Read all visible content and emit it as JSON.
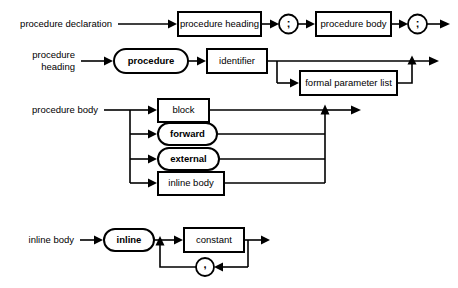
{
  "diagram": {
    "kind": "railroad-syntax-diagram",
    "background_color": "#ffffff",
    "line_color": "#000000",
    "rules": [
      {
        "id": "procedure-declaration",
        "label": "procedure declaration",
        "nodes": [
          {
            "name": "procedure-heading",
            "text": "procedure heading",
            "shape": "rect"
          },
          {
            "name": "semicolon-1",
            "text": ";",
            "shape": "circle"
          },
          {
            "name": "procedure-body",
            "text": "procedure body",
            "shape": "rect"
          },
          {
            "name": "semicolon-2",
            "text": ";",
            "shape": "circle"
          }
        ]
      },
      {
        "id": "procedure-heading",
        "label_line1": "procedure",
        "label_line2": "heading",
        "label": "procedure heading",
        "nodes": [
          {
            "name": "procedure-keyword",
            "text": "procedure",
            "shape": "stadium"
          },
          {
            "name": "identifier",
            "text": "identifier",
            "shape": "rect"
          },
          {
            "name": "formal-parameter-list",
            "text": "formal parameter list",
            "shape": "rect",
            "optional": true
          }
        ]
      },
      {
        "id": "procedure-body",
        "label": "procedure body",
        "alternatives": [
          {
            "name": "block",
            "text": "block",
            "shape": "rect"
          },
          {
            "name": "forward",
            "text": "forward",
            "shape": "stadium"
          },
          {
            "name": "external",
            "text": "external",
            "shape": "stadium"
          },
          {
            "name": "inline-body",
            "text": "inline body",
            "shape": "rect"
          }
        ]
      },
      {
        "id": "inline-body",
        "label": "inline body",
        "nodes": [
          {
            "name": "inline-keyword",
            "text": "inline",
            "shape": "stadium"
          },
          {
            "name": "constant",
            "text": "constant",
            "shape": "rect"
          },
          {
            "name": "comma-separator",
            "text": ",",
            "shape": "circle",
            "loop": true
          }
        ]
      }
    ]
  }
}
